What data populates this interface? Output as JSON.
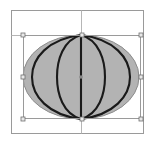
{
  "app": {
    "title": "Vector Canvas",
    "view_label": "Shape Editor Canvas"
  },
  "canvas": {
    "width": 161,
    "height": 144,
    "background_color": "#ffffff",
    "artboard": {
      "label": "artboard-frame",
      "x": 11,
      "y": 10,
      "width": 133,
      "height": 124,
      "stroke_color": "#9a9a9a",
      "fill_color": "#ffffff"
    }
  },
  "guides": {
    "stroke_color": "#b0b0b0",
    "items": [
      {
        "name": "vertical-center-guide",
        "orientation": "vertical",
        "position": 81
      },
      {
        "name": "horizontal-top-guide",
        "orientation": "horizontal",
        "position": 35
      }
    ]
  },
  "shape": {
    "name": "sphere-ellipse",
    "type": "ellipse",
    "fill_color": "#b3b3b3",
    "stroke_color": "#8c8c8c",
    "center_x": 81,
    "center_y": 77,
    "radius_x": 58,
    "radius_y": 42,
    "meridian_stroke_color": "#1a1a1a",
    "meridian_stroke_width": 2.1,
    "meridian_count": 5,
    "meridian_offsets": [
      0,
      14,
      28,
      -14,
      -28
    ]
  },
  "selection": {
    "name": "selection-bounding-box",
    "stroke_color": "#9a9a9a",
    "x": 23,
    "y": 35,
    "width": 118,
    "height": 84,
    "handle_fill": "#e8e8e8",
    "handle_stroke": "#707070",
    "handle_size": 4,
    "handles": [
      {
        "name": "handle-top-left",
        "x": 23,
        "y": 35
      },
      {
        "name": "handle-top-center",
        "x": 82,
        "y": 35
      },
      {
        "name": "handle-top-right",
        "x": 141,
        "y": 35
      },
      {
        "name": "handle-middle-left",
        "x": 23,
        "y": 77
      },
      {
        "name": "handle-middle-right",
        "x": 141,
        "y": 77
      },
      {
        "name": "handle-bottom-left",
        "x": 23,
        "y": 119
      },
      {
        "name": "handle-bottom-center",
        "x": 82,
        "y": 119
      },
      {
        "name": "handle-bottom-right",
        "x": 141,
        "y": 119
      }
    ],
    "center_marker": {
      "name": "rotation-center-marker",
      "x": 81,
      "y": 77,
      "radius": 1.8,
      "fill": "#888888"
    }
  }
}
